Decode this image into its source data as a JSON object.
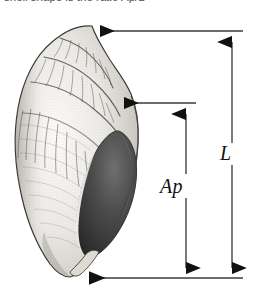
{
  "figure": {
    "kind": "scientific-illustration",
    "caption": "shell shape is the ratio Ap/L",
    "background_color": "#ffffff",
    "ink_color": "#1a1a1a"
  },
  "measurements": [
    {
      "id": "aperture-length",
      "label": "Ap",
      "description": "aperture length",
      "orientation": "vertical",
      "axis_x": 186,
      "top_y": 104,
      "bottom_y": 278,
      "label_x": 160,
      "label_y": 176,
      "leader_from_x": 196,
      "leader_to_x": 112,
      "leader_y": 103
    },
    {
      "id": "shell-length",
      "label": "L",
      "description": "total shell length",
      "orientation": "vertical",
      "axis_x": 232,
      "top_y": 31,
      "bottom_y": 278,
      "label_x": 220,
      "label_y": 143,
      "leader_from_x": 243,
      "leader_to_x": 88,
      "leader_y": 31
    }
  ],
  "baseline": {
    "id": "bottom-reference-line",
    "y": 278,
    "from_x": 243,
    "to_x": 77
  },
  "shell": {
    "name": "whelk-shell",
    "apex_label": "spire-apex",
    "aperture_label": "aperture",
    "siphonal_canal_label": "siphonal-canal",
    "outline_color": "#2b2b2b",
    "body_fill": "#f4f3f1",
    "aperture_fill": "#3a3a3a"
  },
  "colors": {
    "ink": "#1a1a1a",
    "line": "#3c3c3c",
    "shade_dark": "#4a4a4a",
    "shade_mid": "#9a9a98",
    "shade_light": "#d8d6d2",
    "paper": "#ffffff"
  }
}
